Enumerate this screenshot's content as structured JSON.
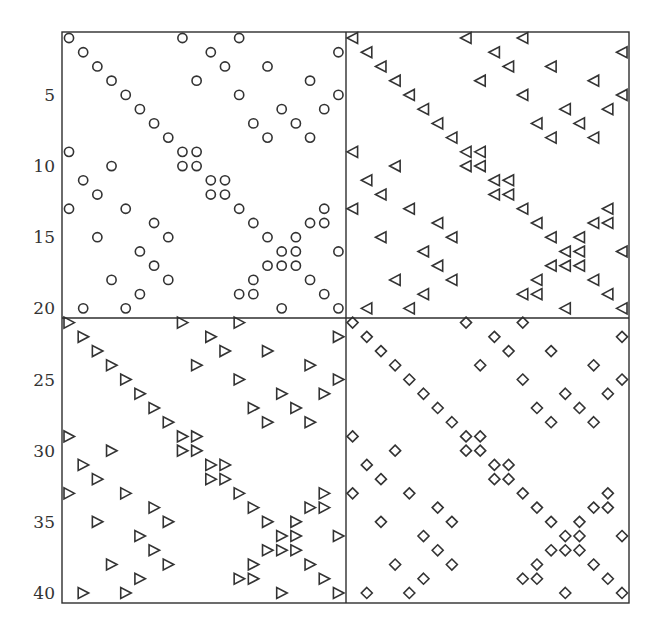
{
  "chart_data": {
    "type": "scatter",
    "subtype": "sparsity-pattern (spy plot)",
    "title": "",
    "xlabel": "",
    "ylabel": "",
    "matrix_size": [
      40,
      40
    ],
    "xlim": [
      0.5,
      40.5
    ],
    "ylim": [
      40.5,
      0.5
    ],
    "y_ticks": [
      5,
      10,
      15,
      20,
      25,
      30,
      35,
      40
    ],
    "x_ticks": [],
    "grid": false,
    "block_dividers": {
      "row": 20.5,
      "col": 20.5
    },
    "block_pattern_rows": [
      [
        1,
        9,
        13
      ],
      [
        2,
        11,
        20
      ],
      [
        3,
        12,
        15
      ],
      [
        4,
        10,
        18
      ],
      [
        5,
        13,
        20
      ],
      [
        6,
        16,
        19
      ],
      [
        7,
        14,
        17
      ],
      [
        8,
        15,
        18
      ],
      [
        1,
        9,
        10
      ],
      [
        4,
        9,
        10
      ],
      [
        2,
        11,
        12
      ],
      [
        3,
        11,
        12
      ],
      [
        1,
        5,
        13,
        19
      ],
      [
        7,
        14,
        18,
        19
      ],
      [
        3,
        8,
        15,
        17
      ],
      [
        6,
        16,
        17,
        20
      ],
      [
        7,
        15,
        16,
        17
      ],
      [
        4,
        8,
        14,
        18
      ],
      [
        6,
        13,
        14,
        19
      ],
      [
        2,
        5,
        16,
        20
      ]
    ],
    "series": [
      {
        "name": "block (1,1)",
        "marker": "circle",
        "row_offset": 0,
        "col_offset": 0
      },
      {
        "name": "block (1,2)",
        "marker": "triangle-left",
        "row_offset": 0,
        "col_offset": 20
      },
      {
        "name": "block (2,1)",
        "marker": "triangle-right",
        "row_offset": 20,
        "col_offset": 0
      },
      {
        "name": "block (2,2)",
        "marker": "diamond",
        "row_offset": 20,
        "col_offset": 20
      }
    ],
    "nonzeros_per_block": 67,
    "total_nonzeros": 268
  },
  "colors": {
    "background": "#ffffff",
    "marker_stroke": "#333333",
    "axis": "#2e2e2e"
  }
}
